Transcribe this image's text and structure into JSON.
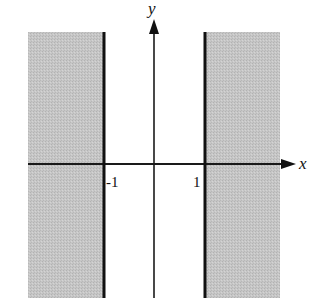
{
  "diagram": {
    "title": "",
    "axes": {
      "x_label": "x",
      "y_label": "y"
    },
    "ticks": {
      "left": "-1",
      "right": "1"
    },
    "regions": [
      {
        "name": "left-shaded-region",
        "condition": "x <= -1"
      },
      {
        "name": "right-shaded-region",
        "condition": "x >= 1"
      }
    ],
    "boundaries": [
      {
        "name": "line-x-neg1",
        "equation": "x = -1"
      },
      {
        "name": "line-x-pos1",
        "equation": "x = 1"
      }
    ],
    "colors": {
      "shade": "#c4c4c4",
      "line": "#111111",
      "background": "#ffffff"
    }
  }
}
